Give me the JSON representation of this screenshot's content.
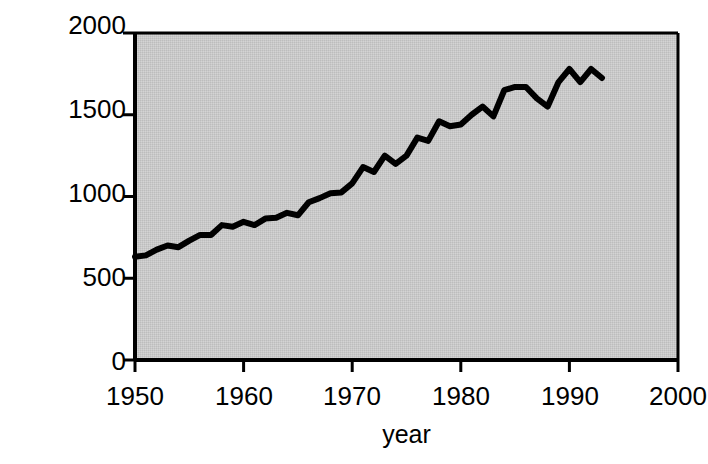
{
  "chart_data": {
    "type": "line",
    "title": "",
    "xlabel": "year",
    "ylabel": "Grain Produced (millions of tons)",
    "ylabel_line1": "Grain Produced",
    "ylabel_line2": "(millions of tons)",
    "xlim": [
      1950,
      2000
    ],
    "ylim": [
      0,
      2000
    ],
    "xticks": [
      1950,
      1960,
      1970,
      1980,
      1990,
      2000
    ],
    "yticks": [
      0,
      500,
      1000,
      1500,
      2000
    ],
    "xtick_labels": [
      "1950",
      "1960",
      "1970",
      "1980",
      "1990",
      "2000"
    ],
    "ytick_labels": [
      "0",
      "500",
      "1000",
      "1500",
      "2000"
    ],
    "grid": false,
    "legend": "none",
    "plot_bgcolor": "#c8c8c8",
    "line_color": "#000000",
    "axis_color": "#000000",
    "series": [
      {
        "name": "World Grain Production",
        "x": [
          1950,
          1951,
          1952,
          1953,
          1954,
          1955,
          1956,
          1957,
          1958,
          1959,
          1960,
          1961,
          1962,
          1963,
          1964,
          1965,
          1966,
          1967,
          1968,
          1969,
          1970,
          1971,
          1972,
          1973,
          1974,
          1975,
          1976,
          1977,
          1978,
          1979,
          1980,
          1981,
          1982,
          1983,
          1984,
          1985,
          1986,
          1987,
          1988,
          1989,
          1990,
          1991,
          1992,
          1993
        ],
        "values": [
          631,
          640,
          675,
          700,
          690,
          730,
          765,
          765,
          825,
          815,
          845,
          825,
          865,
          870,
          900,
          885,
          965,
          990,
          1020,
          1025,
          1080,
          1180,
          1150,
          1250,
          1200,
          1250,
          1360,
          1340,
          1460,
          1430,
          1440,
          1500,
          1550,
          1490,
          1650,
          1670,
          1670,
          1600,
          1550,
          1700,
          1780,
          1700,
          1780,
          1725
        ]
      }
    ]
  }
}
